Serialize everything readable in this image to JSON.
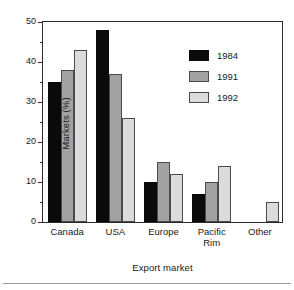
{
  "chart_data": {
    "type": "bar",
    "title": "",
    "xlabel": "Export market",
    "ylabel": "Markets (%)",
    "categories": [
      "Canada",
      "USA",
      "Europe",
      "Pacific\nRim",
      "Other"
    ],
    "series": [
      {
        "name": "1984",
        "color": "#0a0a0a",
        "values": [
          35,
          48,
          10,
          7,
          null
        ]
      },
      {
        "name": "1991",
        "color": "#a2a2a2",
        "values": [
          38,
          37,
          15,
          10,
          null
        ]
      },
      {
        "name": "1992",
        "color": "#dcdcdc",
        "values": [
          43,
          26,
          12,
          14,
          5
        ]
      }
    ],
    "ylim": [
      0,
      50
    ],
    "yticks": [
      0,
      10,
      20,
      30,
      40,
      50
    ],
    "ytick_labels": [
      "0",
      "10",
      "20",
      "30",
      "40",
      "50"
    ],
    "yminor_ticks": [
      5,
      15,
      25,
      35,
      45
    ],
    "grid": false,
    "legend_position": "upper right"
  }
}
